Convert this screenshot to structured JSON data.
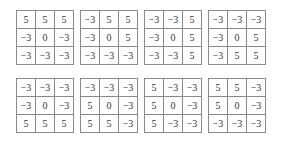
{
  "figure": {
    "matrices": [
      [
        [
          "5",
          "5",
          "5"
        ],
        [
          "−3",
          "0",
          "−3"
        ],
        [
          "−3",
          "−3",
          "−3"
        ]
      ],
      [
        [
          "−3",
          "5",
          "5"
        ],
        [
          "−3",
          "0",
          "5"
        ],
        [
          "−3",
          "−3",
          "−3"
        ]
      ],
      [
        [
          "−3",
          "−3",
          "5"
        ],
        [
          "−3",
          "0",
          "5"
        ],
        [
          "−3",
          "−3",
          "5"
        ]
      ],
      [
        [
          "−3",
          "−3",
          "−3"
        ],
        [
          "−3",
          "0",
          "5"
        ],
        [
          "−3",
          "5",
          "5"
        ]
      ],
      [
        [
          "−3",
          "−3",
          "−3"
        ],
        [
          "−3",
          "0",
          "−3"
        ],
        [
          "5",
          "5",
          "5"
        ]
      ],
      [
        [
          "−3",
          "−3",
          "−3"
        ],
        [
          "5",
          "0",
          "−3"
        ],
        [
          "5",
          "5",
          "−3"
        ]
      ],
      [
        [
          "5",
          "−3",
          "−3"
        ],
        [
          "5",
          "0",
          "−3"
        ],
        [
          "5",
          "−3",
          "−3"
        ]
      ],
      [
        [
          "5",
          "5",
          "−3"
        ],
        [
          "5",
          "0",
          "−3"
        ],
        [
          "−3",
          "−3",
          "−3"
        ]
      ]
    ]
  }
}
